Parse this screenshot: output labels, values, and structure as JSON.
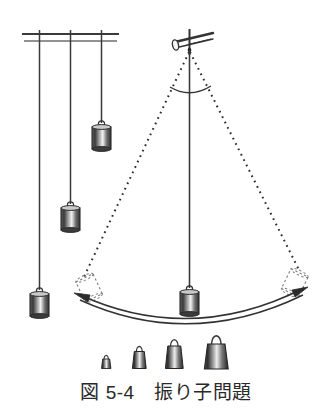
{
  "figure": {
    "caption_number": "図 5-4",
    "caption_gap": "　",
    "caption_title": "振り子問題",
    "caption_full": "図 5-4　振り子問題",
    "background_color": "#ffffff",
    "ink_color": "#333333"
  },
  "apparatus": {
    "support_rod_label": "support-rod",
    "pivot_label": "pivot-point",
    "angle_arc_label": "swing-angle-arc",
    "swing_arc_label": "swing-path-arc"
  },
  "fixed_pendulums": [
    {
      "name": "pendulum-short-left",
      "string_length_px": 272,
      "bob_size": "medium"
    },
    {
      "name": "pendulum-medium",
      "string_length_px": 198,
      "bob_size": "medium"
    },
    {
      "name": "pendulum-long",
      "string_length_px": 90,
      "bob_size": "medium"
    }
  ],
  "swinging_pendulum": {
    "name": "pendulum-swinging",
    "string_length_px": 255,
    "rest_position": "center",
    "left_ghost_label": "ghost-bob-left",
    "right_ghost_label": "ghost-bob-right",
    "arrow_left_label": "arrow-head-left",
    "arrow_right_label": "arrow-head-right"
  },
  "weights_row": {
    "label": "weights-set",
    "items": [
      {
        "name": "weight-smallest",
        "relative_size": 1
      },
      {
        "name": "weight-small",
        "relative_size": 2
      },
      {
        "name": "weight-medium",
        "relative_size": 3
      },
      {
        "name": "weight-large",
        "relative_size": 4
      }
    ]
  }
}
